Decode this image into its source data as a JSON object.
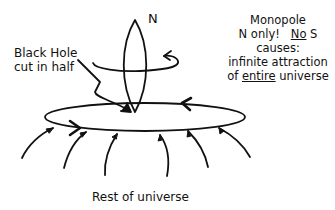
{
  "diagram": {
    "pole_label": "N",
    "black_hole_label": {
      "line1": "Black Hole",
      "line2": "cut in half"
    },
    "monopole_note": {
      "line1": "Monopole",
      "line2_a": "N only!",
      "line2_b": "No",
      "line2_c": " S",
      "line3": "causes:",
      "line4": "infinite attraction",
      "line5_a": "of ",
      "line5_b": "entire",
      "line5_c": " universe"
    },
    "bottom_label": "Rest of universe",
    "colors": {
      "ink": "#111111",
      "background": "#ffffff"
    }
  }
}
